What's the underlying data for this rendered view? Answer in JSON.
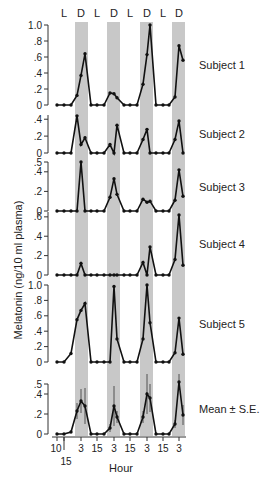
{
  "chart_data": {
    "type": "line",
    "ylabel": "Melatonin (ng/10 ml plasma)",
    "xlabel": "Hour",
    "ld_labels": [
      "L",
      "D",
      "L",
      "D",
      "L",
      "D",
      "L",
      "D"
    ],
    "x_ticks": [
      "10",
      "3",
      "15",
      "3",
      "15",
      "3",
      "15",
      "3"
    ],
    "x_start_second_label": "15",
    "shade_color": "#c8c8c8",
    "x": [
      0,
      1,
      2,
      3,
      4,
      5,
      6,
      7,
      8,
      9,
      10,
      11,
      12,
      13,
      14,
      15,
      16,
      17,
      18,
      19,
      20,
      21,
      22,
      23
    ],
    "panels": [
      {
        "name": "Subject 1",
        "ylim": [
          0,
          1.0
        ],
        "yticks": [
          "0",
          ".2",
          ".4",
          ".6",
          ".8",
          "1.0"
        ],
        "values": [
          0,
          0,
          0,
          0.12,
          0.37,
          0.64,
          0,
          0,
          0,
          0.15,
          0.14,
          0.09,
          0,
          0,
          0,
          0.26,
          0.63,
          1.0,
          0,
          0,
          0,
          0.1,
          0.74,
          0.56
        ]
      },
      {
        "name": "Subject 2",
        "ylim": [
          0,
          0.45
        ],
        "yticks": [
          "0",
          ".2",
          ".4"
        ],
        "values": [
          0,
          0,
          0,
          0.44,
          0.1,
          0.18,
          0,
          0,
          0,
          0.1,
          0,
          0.33,
          0,
          0,
          0,
          0.16,
          0.28,
          0,
          0,
          0,
          0,
          0.16,
          0.38,
          0
        ]
      },
      {
        "name": "Subject 3",
        "ylim": [
          0,
          0.5
        ],
        "yticks": [
          "0",
          ".2",
          ".4",
          ".5"
        ],
        "values": [
          0,
          0,
          0,
          0,
          0.5,
          0,
          0,
          0,
          0,
          0.14,
          0.33,
          0.17,
          0,
          0,
          0,
          0.12,
          0.09,
          0.1,
          0,
          0,
          0,
          0.11,
          0.42,
          0.15
        ]
      },
      {
        "name": "Subject 4",
        "ylim": [
          0,
          0.65
        ],
        "yticks": [
          "0",
          ".2",
          ".4",
          ".6"
        ],
        "values": [
          0,
          0,
          0,
          0,
          0.12,
          0,
          0,
          0,
          0,
          0,
          0,
          0,
          0,
          0,
          0,
          0.13,
          0,
          0.29,
          0,
          0,
          0,
          0.16,
          0.62,
          0.1
        ]
      },
      {
        "name": "Subject 5",
        "ylim": [
          0,
          1.0
        ],
        "yticks": [
          "0",
          ".2",
          ".4",
          ".6",
          ".8",
          "1.0"
        ],
        "values": [
          0,
          0,
          0.11,
          0.55,
          0.67,
          0.76,
          0,
          0,
          0,
          0,
          0.98,
          0.3,
          0,
          0,
          0,
          0.3,
          1.0,
          0.51,
          0,
          0,
          0,
          0.12,
          0.57,
          0.1
        ]
      },
      {
        "name": "Mean ± S.E.",
        "ylim": [
          0,
          0.5
        ],
        "yticks": [
          "0",
          ".2",
          ".4",
          ".5"
        ],
        "values": [
          0,
          0,
          0.02,
          0.23,
          0.33,
          0.28,
          0,
          0,
          0,
          0.06,
          0.28,
          0.17,
          0,
          0,
          0,
          0.17,
          0.4,
          0.36,
          0,
          0,
          0,
          0.1,
          0.52,
          0.19
        ],
        "se": [
          0,
          0,
          0.01,
          0.08,
          0.12,
          0.18,
          0,
          0,
          0,
          0.04,
          0.2,
          0.06,
          0,
          0,
          0,
          0.06,
          0.2,
          0.14,
          0,
          0,
          0,
          0.04,
          0.08,
          0.1
        ]
      }
    ]
  }
}
